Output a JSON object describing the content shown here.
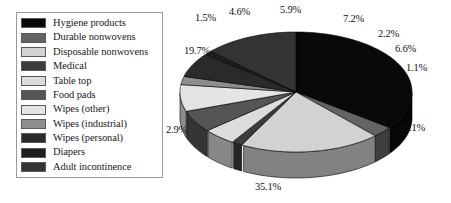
{
  "chart_data": {
    "type": "pie",
    "title": "",
    "subtitle": "",
    "xlabel": "",
    "ylabel": "",
    "legend_position": "left",
    "grid": false,
    "three_d": true,
    "value_unit": "%",
    "categories": [
      "Hygiene products",
      "Durable nonwovens",
      "Disposable nonwovens",
      "Medical",
      "Table top",
      "Food pads",
      "Wipes (other)",
      "Wipes (industrial)",
      "Wipes (personal)",
      "Diapers",
      "Adult incontinence"
    ],
    "values": [
      35.1,
      2.9,
      19.7,
      1.5,
      4.6,
      5.9,
      7.2,
      2.2,
      6.6,
      1.1,
      13.1
    ],
    "labels": [
      "35.1%",
      "2.9%",
      "19.7%",
      "1.5%",
      "4.6%",
      "5.9%",
      "7.2%",
      "2.2%",
      "6.6%",
      "1.1%",
      "13.1%"
    ],
    "colors": [
      "#090909",
      "#646464",
      "#d2d2d2",
      "#3c3c3c",
      "#dcdcdc",
      "#555555",
      "#e4e4e4",
      "#8e8e8e",
      "#2a2a2a",
      "#1e1e1e",
      "#333333"
    ]
  },
  "legend": {
    "items": [
      {
        "label": "Hygiene products",
        "color": "#090909"
      },
      {
        "label": "Durable nonwovens",
        "color": "#646464"
      },
      {
        "label": "Disposable nonwovens",
        "color": "#d2d2d2"
      },
      {
        "label": "Medical",
        "color": "#3c3c3c"
      },
      {
        "label": "Table top",
        "color": "#dcdcdc"
      },
      {
        "label": "Food pads",
        "color": "#555555"
      },
      {
        "label": "Wipes (other)",
        "color": "#e4e4e4"
      },
      {
        "label": "Wipes (industrial)",
        "color": "#8e8e8e"
      },
      {
        "label": "Wipes (personal)",
        "color": "#2a2a2a"
      },
      {
        "label": "Diapers",
        "color": "#1e1e1e"
      },
      {
        "label": "Adult incontinence",
        "color": "#333333"
      }
    ]
  },
  "pie_labels": [
    {
      "text": "1.5%",
      "left": 32,
      "top": 12
    },
    {
      "text": "4.6%",
      "left": 66,
      "top": 6
    },
    {
      "text": "5.9%",
      "left": 117,
      "top": 4
    },
    {
      "text": "7.2%",
      "left": 180,
      "top": 13
    },
    {
      "text": "2.2%",
      "left": 215,
      "top": 28
    },
    {
      "text": "6.6%",
      "left": 232,
      "top": 43
    },
    {
      "text": "1.1%",
      "left": 243,
      "top": 62
    },
    {
      "text": "13.1%",
      "left": 236,
      "top": 122
    },
    {
      "text": "35.1%",
      "left": 92,
      "top": 181
    },
    {
      "text": "2.9%",
      "left": 3,
      "top": 124
    },
    {
      "text": "19.7%",
      "left": 21,
      "top": 45
    }
  ],
  "pie_geometry": {
    "cx": 133,
    "cy": 92,
    "rx": 116,
    "ry": 60,
    "depth": 26,
    "start_angle_deg": -90,
    "note": "slices drawn clockwise from 12 o'clock"
  }
}
